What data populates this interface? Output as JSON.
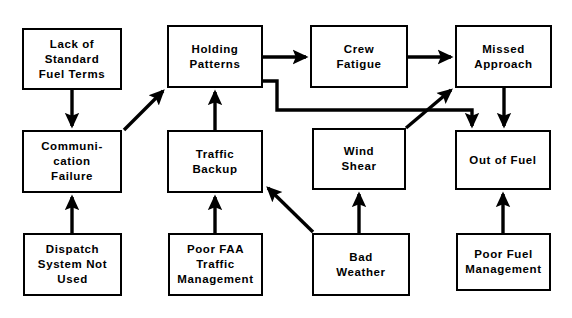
{
  "diagram": {
    "background_color": "#ffffff",
    "line_color": "#000000",
    "text_color": "#000000",
    "nodes": [
      {
        "id": "lack-of-standard-fuel-terms",
        "label": "Lack of\nStandard\nFuel Terms",
        "x": 22,
        "y": 28,
        "w": 100,
        "h": 62
      },
      {
        "id": "holding-patterns",
        "label": "Holding\nPatterns",
        "x": 167,
        "y": 25,
        "w": 96,
        "h": 63
      },
      {
        "id": "crew-fatigue",
        "label": "Crew\nFatigue",
        "x": 310,
        "y": 25,
        "w": 98,
        "h": 63
      },
      {
        "id": "missed-approach",
        "label": "Missed\nApproach",
        "x": 455,
        "y": 25,
        "w": 97,
        "h": 63
      },
      {
        "id": "communication-failure",
        "label": "Communi-\ncation\nFailure",
        "x": 22,
        "y": 130,
        "w": 100,
        "h": 63
      },
      {
        "id": "traffic-backup",
        "label": "Traffic\nBackup",
        "x": 167,
        "y": 130,
        "w": 96,
        "h": 63
      },
      {
        "id": "wind-shear",
        "label": "Wind\nShear",
        "x": 312,
        "y": 128,
        "w": 94,
        "h": 62
      },
      {
        "id": "out-of-fuel",
        "label": "Out of Fuel",
        "x": 455,
        "y": 130,
        "w": 96,
        "h": 60
      },
      {
        "id": "dispatch-system-not-used",
        "label": "Dispatch\nSystem Not\nUsed",
        "x": 23,
        "y": 233,
        "w": 99,
        "h": 63
      },
      {
        "id": "poor-faa-traffic-management",
        "label": "Poor FAA\nTraffic\nManagement",
        "x": 168,
        "y": 233,
        "w": 95,
        "h": 63
      },
      {
        "id": "bad-weather",
        "label": "Bad\nWeather",
        "x": 312,
        "y": 233,
        "w": 98,
        "h": 63
      },
      {
        "id": "poor-fuel-management",
        "label": "Poor Fuel\nManagement",
        "x": 456,
        "y": 233,
        "w": 95,
        "h": 58
      }
    ],
    "edges": [
      {
        "id": "edge-fuel-terms-to-communication-failure",
        "from": "lack-of-standard-fuel-terms",
        "to": "communication-failure",
        "kind": "vertical-down",
        "points": "72,90 72,126"
      },
      {
        "id": "edge-dispatch-to-communication-failure",
        "from": "dispatch-system-not-used",
        "to": "communication-failure",
        "kind": "vertical-up",
        "points": "72,233 72,197"
      },
      {
        "id": "edge-communication-failure-to-holding-patterns",
        "from": "communication-failure",
        "to": "holding-patterns",
        "kind": "diagonal-up-right",
        "points": "124,130 163,91"
      },
      {
        "id": "edge-traffic-backup-to-holding-patterns",
        "from": "traffic-backup",
        "to": "holding-patterns",
        "kind": "vertical-up",
        "points": "215,130 215,92"
      },
      {
        "id": "edge-poor-faa-to-traffic-backup",
        "from": "poor-faa-traffic-management",
        "to": "traffic-backup",
        "kind": "vertical-up",
        "points": "215,233 215,197"
      },
      {
        "id": "edge-holding-patterns-to-crew-fatigue",
        "from": "holding-patterns",
        "to": "crew-fatigue",
        "kind": "horizontal-right",
        "points": "263,57 306,57"
      },
      {
        "id": "edge-crew-fatigue-to-missed-approach",
        "from": "crew-fatigue",
        "to": "missed-approach",
        "kind": "horizontal-right",
        "points": "408,57 451,57"
      },
      {
        "id": "edge-holding-patterns-to-out-of-fuel",
        "from": "holding-patterns",
        "to": "out-of-fuel",
        "kind": "orthogonal-right-down-right-down",
        "points": "263,81 277,81 277,110 472,110 472,126"
      },
      {
        "id": "edge-missed-approach-to-out-of-fuel",
        "from": "missed-approach",
        "to": "out-of-fuel",
        "kind": "vertical-down",
        "points": "504,88 504,126"
      },
      {
        "id": "edge-poor-fuel-management-to-out-of-fuel",
        "from": "poor-fuel-management",
        "to": "out-of-fuel",
        "kind": "vertical-up",
        "points": "503,233 503,194"
      },
      {
        "id": "edge-bad-weather-to-wind-shear",
        "from": "bad-weather",
        "to": "wind-shear",
        "kind": "vertical-up",
        "points": "359,233 359,194"
      },
      {
        "id": "edge-bad-weather-to-traffic-backup",
        "from": "bad-weather",
        "to": "traffic-backup",
        "kind": "diagonal-up-left",
        "points": "313,232 268,188"
      },
      {
        "id": "edge-bad-weather-to-missed-approach",
        "from": "bad-weather",
        "to": "missed-approach",
        "kind": "diagonal-up-right",
        "points": "406,128 451,90"
      }
    ]
  }
}
